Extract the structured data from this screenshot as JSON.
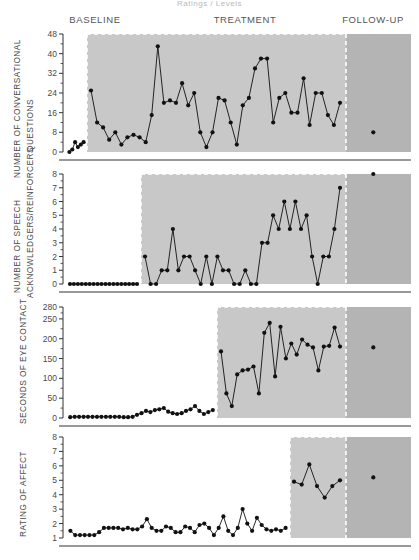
{
  "figure": {
    "title": "Ratings / Levels",
    "phases": [
      {
        "name": "BASELINE",
        "label": "BASELINE"
      },
      {
        "name": "TREATMENT",
        "label": "TREATMENT"
      },
      {
        "name": "FOLLOW-UP",
        "label": "FOLLOW-UP"
      }
    ]
  },
  "chart_data": [
    {
      "type": "line",
      "panel": 1,
      "title": "Number of Conversational Questions",
      "ylabel": "NUMBER OF CONVERSATIONAL QUESTIONS",
      "xlabel": "",
      "ylim": [
        0,
        48
      ],
      "yticks": [
        0,
        8,
        16,
        24,
        32,
        40,
        48
      ],
      "ytick_labels": [
        "0",
        "8",
        "16",
        "24",
        "32",
        "40",
        "48"
      ],
      "grid": false,
      "legend": "none",
      "phase_boundaries": {
        "baseline_end_session": 6,
        "treatment_end_session": 48
      },
      "series": [
        {
          "name": "Baseline",
          "phase": "BASELINE",
          "x": [
            1,
            2,
            3,
            4,
            5,
            6
          ],
          "values": [
            0,
            1,
            4,
            2,
            3,
            4
          ]
        },
        {
          "name": "Treatment",
          "phase": "TREATMENT",
          "x": [
            7,
            8,
            9,
            10,
            11,
            12,
            13,
            14,
            15,
            16,
            17,
            18,
            19,
            20,
            21,
            22,
            23,
            24,
            25,
            26,
            27,
            28,
            29,
            30,
            31,
            32,
            33,
            34,
            35,
            36,
            37,
            38,
            39,
            40,
            41,
            42,
            43,
            44,
            45,
            46,
            47,
            48
          ],
          "values": [
            25,
            12,
            10,
            5,
            8,
            3,
            6,
            7,
            6,
            4,
            15,
            43,
            20,
            21,
            20,
            28,
            19,
            24,
            8,
            2,
            8,
            22,
            21,
            12,
            3,
            19,
            22,
            34,
            38,
            38,
            12,
            22,
            24,
            16,
            16,
            30,
            11,
            24,
            24,
            15,
            11,
            20
          ]
        },
        {
          "name": "Follow-up",
          "phase": "FOLLOW-UP",
          "x": [
            53
          ],
          "values": [
            8
          ]
        }
      ]
    },
    {
      "type": "line",
      "panel": 2,
      "title": "Number of Speech Acknowledgers/Reinforcers",
      "ylabel": "NUMBER OF SPEECH ACKNOWLEDGERS/REINFORCERS",
      "xlabel": "",
      "ylim": [
        0,
        8
      ],
      "yticks": [
        0,
        1,
        2,
        3,
        4,
        5,
        6,
        7,
        8
      ],
      "ytick_labels": [
        "0",
        "1",
        "2",
        "3",
        "4",
        "5",
        "6",
        "7",
        "8"
      ],
      "grid": false,
      "legend": "none",
      "phase_boundaries": {
        "baseline_end_session": 18,
        "treatment_end_session": 48
      },
      "series": [
        {
          "name": "Baseline",
          "phase": "BASELINE",
          "x": [
            1,
            2,
            3,
            4,
            5,
            6,
            7,
            8,
            9,
            10,
            11,
            12,
            13,
            14,
            15,
            16,
            17,
            18
          ],
          "values": [
            0,
            0,
            0,
            0,
            0,
            0,
            0,
            0,
            0,
            0,
            0,
            0,
            0,
            0,
            0,
            0,
            0,
            0
          ]
        },
        {
          "name": "Treatment",
          "phase": "TREATMENT",
          "x": [
            19,
            20,
            21,
            22,
            23,
            24,
            25,
            26,
            27,
            28,
            29,
            30,
            31,
            32,
            33,
            34,
            35,
            36,
            37,
            38,
            39,
            40,
            41,
            42,
            43,
            44,
            45,
            46,
            47,
            48
          ],
          "values": [
            2,
            0,
            0,
            1,
            1,
            4,
            1,
            2,
            2,
            1,
            0,
            2,
            0,
            2,
            1,
            1,
            0,
            0,
            1,
            0,
            0,
            3,
            3,
            5,
            4,
            6,
            4,
            6,
            4,
            5
          ]
        },
        {
          "name": "Treatment-late",
          "phase": "TREATMENT",
          "x": [
            49,
            50,
            51,
            52,
            53,
            54
          ],
          "values": [
            2,
            0,
            2,
            2,
            4,
            7
          ]
        },
        {
          "name": "Follow-up",
          "phase": "FOLLOW-UP",
          "x": [
            60
          ],
          "values": [
            8
          ]
        }
      ]
    },
    {
      "type": "line",
      "panel": 3,
      "title": "Seconds of Eye Contact",
      "ylabel": "SECONDS OF EYE CONTACT",
      "xlabel": "",
      "ylim": [
        0,
        280
      ],
      "yticks": [
        0,
        50,
        100,
        150,
        200,
        250,
        280
      ],
      "ytick_labels": [
        "0",
        "50",
        "100",
        "150",
        "200",
        "250",
        "280"
      ],
      "grid": false,
      "legend": "none",
      "phase_boundaries": {
        "baseline_end_session": 33,
        "treatment_end_session": 56
      },
      "series": [
        {
          "name": "Baseline",
          "phase": "BASELINE",
          "x": [
            1,
            2,
            3,
            4,
            5,
            6,
            7,
            8,
            9,
            10,
            11,
            12,
            13,
            14,
            15,
            16,
            17,
            18,
            19,
            20,
            21,
            22,
            23,
            24,
            25,
            26,
            27,
            28,
            29,
            30,
            31,
            32,
            33
          ],
          "values": [
            2,
            3,
            3,
            3,
            3,
            3,
            3,
            3,
            3,
            3,
            3,
            3,
            2,
            2,
            3,
            8,
            12,
            18,
            15,
            20,
            22,
            25,
            16,
            12,
            10,
            12,
            18,
            22,
            30,
            18,
            10,
            15,
            20
          ]
        },
        {
          "name": "Treatment",
          "phase": "TREATMENT",
          "x": [
            34,
            35,
            36,
            37,
            38,
            39,
            40,
            41,
            42,
            43,
            44,
            45,
            46,
            47,
            48,
            49,
            50,
            51,
            52,
            53,
            54,
            55,
            56
          ],
          "values": [
            168,
            62,
            30,
            110,
            120,
            122,
            130,
            62,
            215,
            240,
            105,
            230,
            150,
            188,
            160,
            198,
            185,
            178,
            120,
            180,
            182,
            228,
            180
          ]
        },
        {
          "name": "Follow-up",
          "phase": "FOLLOW-UP",
          "x": [
            62
          ],
          "values": [
            178
          ]
        }
      ]
    },
    {
      "type": "line",
      "panel": 4,
      "title": "Rating of Affect",
      "ylabel": "RATING OF AFFECT",
      "xlabel": "",
      "ylim": [
        1,
        8
      ],
      "yticks": [
        1,
        2,
        3,
        4,
        5,
        6,
        7,
        8
      ],
      "ytick_labels": [
        "1",
        "2",
        "3",
        "4",
        "5",
        "6",
        "7",
        "8"
      ],
      "grid": false,
      "legend": "none",
      "phase_boundaries": {
        "baseline_end_session": 46,
        "treatment_end_session": 58
      },
      "series": [
        {
          "name": "Baseline",
          "phase": "BASELINE",
          "x": [
            1,
            2,
            3,
            4,
            5,
            6,
            7,
            8,
            9,
            10,
            11,
            12,
            13,
            14,
            15,
            16,
            17,
            18,
            19,
            20,
            21,
            22,
            23,
            24,
            25,
            26,
            27,
            28,
            29,
            30,
            31,
            32,
            33,
            34,
            35,
            36,
            37,
            38,
            39,
            40,
            41,
            42,
            43,
            44,
            45,
            46
          ],
          "values": [
            1.5,
            1.2,
            1.2,
            1.2,
            1.2,
            1.2,
            1.4,
            1.7,
            1.7,
            1.7,
            1.7,
            1.6,
            1.7,
            1.6,
            1.6,
            1.8,
            2.3,
            1.7,
            1.5,
            1.5,
            1.8,
            1.7,
            1.4,
            1.4,
            1.8,
            1.7,
            1.4,
            1.9,
            2.0,
            1.7,
            1.2,
            1.7,
            2.5,
            1.5,
            1.2,
            1.7,
            3.0,
            2.0,
            1.5,
            2.4,
            1.9,
            1.6,
            1.5,
            1.6,
            1.5,
            1.7
          ]
        },
        {
          "name": "Treatment",
          "phase": "TREATMENT",
          "x": [
            47,
            48,
            49,
            50,
            51,
            52,
            53
          ],
          "values": [
            4.9,
            4.7,
            6.1,
            4.6,
            3.8,
            4.6,
            5.0
          ]
        },
        {
          "name": "Follow-up",
          "phase": "FOLLOW-UP",
          "x": [
            60
          ],
          "values": [
            5.2
          ]
        }
      ]
    }
  ],
  "colors": {
    "line": "#111111",
    "marker": "#111111",
    "shade_treatment": "#c8c8c8",
    "shade_followup": "#b4b4b4",
    "axis": "#333333",
    "text": "#4a4a4a",
    "dashed_boundary": "#ffffff"
  }
}
